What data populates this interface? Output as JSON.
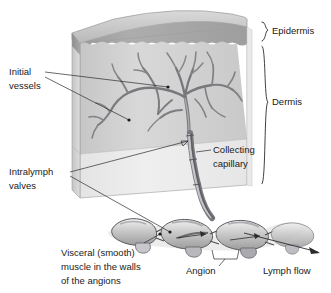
{
  "figure": {
    "background_color": "#ffffff",
    "ink_color": "#1a1a1a",
    "vessel_color": "#6e6e73"
  },
  "labels": {
    "initial_vessels": {
      "line1": "Initial",
      "line2": "vessels"
    },
    "intralymph_valves": {
      "line1": "Intralymph",
      "line2": "valves"
    },
    "collecting_capillary": {
      "line1": "Collecting",
      "line2": "capillary"
    },
    "epidermis": {
      "line1": "Epidermis"
    },
    "dermis": {
      "line1": "Dermis"
    },
    "visceral_muscle": {
      "line1": "Visceral (smooth)",
      "line2": "muscle in the walls",
      "line3": "of the angions"
    },
    "angion": {
      "line1": "Angion"
    },
    "lymph_flow": {
      "line1": "Lymph flow"
    }
  },
  "layers": {
    "epidermis": {
      "name": "Epidermis",
      "fill": "#a8a8a8"
    },
    "dermis": {
      "name": "Dermis",
      "fill": "#d2d2d2"
    },
    "subcutis": {
      "name": "Subcutaneous",
      "fill": "#ececec"
    }
  },
  "structures": {
    "initial_vessel_network": "initial lymphatic vessel plexus",
    "collecting_capillary": "collecting lymphatic capillary",
    "angion_chain": "chain of angions with intralymph valves",
    "flow_direction": "rightward"
  }
}
